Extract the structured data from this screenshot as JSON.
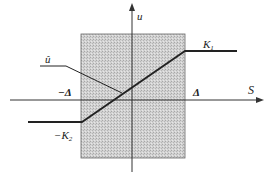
{
  "diagram": {
    "type": "piecewise-linear control law diagram",
    "labels": {
      "u_axis": "u",
      "s_axis": "S",
      "u_hat": "û",
      "upper_level": "K",
      "upper_level_sub": "1",
      "lower_level": "−K",
      "lower_level_sub": "2",
      "neg_delta": "−Δ",
      "pos_delta": "Δ"
    },
    "colors": {
      "line": "#222222",
      "band_fill": "#c9c9c9",
      "band_border": "#555555"
    }
  }
}
